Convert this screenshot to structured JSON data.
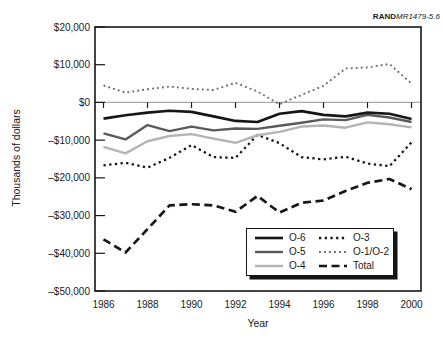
{
  "figure_label": {
    "brand": "RAND",
    "reference": "MR1479-5.6"
  },
  "colors": {
    "background": "#ffffff",
    "axis": "#161616",
    "zero_line": "#a8a8a8",
    "text": "#1a1a1a"
  },
  "chart_data": {
    "type": "line",
    "title": "",
    "xlabel": "Year",
    "ylabel": "Thousands of dollars",
    "x": [
      1986,
      1987,
      1988,
      1989,
      1990,
      1991,
      1992,
      1993,
      1994,
      1995,
      1996,
      1997,
      1998,
      1999,
      2000
    ],
    "xtick_years": [
      1986,
      1988,
      1990,
      1992,
      1994,
      1996,
      1998,
      2000
    ],
    "xtick_labels": [
      "1986",
      "1988",
      "1990",
      "1992",
      "1994",
      "1996",
      "1998",
      "2000"
    ],
    "ytick_values": [
      20000,
      10000,
      0,
      -10000,
      -20000,
      -30000,
      -40000,
      -50000
    ],
    "ytick_labels": [
      "$20,000",
      "$10,000",
      "$0",
      "–$10,000",
      "–$20,000",
      "–$30,000",
      "–$40,000",
      "–$50,000"
    ],
    "ylim": [
      -50000,
      20000
    ],
    "grid": "zero-line-only",
    "legend_position": "inside-bottom-right",
    "series": [
      {
        "name": "O-6",
        "style": "solid",
        "color": "#161616",
        "width": 2.6,
        "dash": "",
        "values": [
          -4300,
          -3400,
          -2700,
          -2200,
          -2500,
          -3700,
          -4900,
          -5200,
          -3000,
          -2300,
          -3300,
          -3700,
          -2700,
          -3000,
          -4400
        ]
      },
      {
        "name": "O-5",
        "style": "solid",
        "color": "#5a5a5a",
        "width": 2.4,
        "dash": "",
        "values": [
          -8200,
          -9800,
          -6000,
          -7600,
          -6400,
          -7400,
          -6900,
          -7000,
          -6200,
          -5400,
          -4500,
          -4700,
          -3300,
          -4000,
          -5200
        ]
      },
      {
        "name": "O-4",
        "style": "solid",
        "color": "#b4b4b4",
        "width": 2.4,
        "dash": "",
        "values": [
          -11800,
          -13500,
          -10300,
          -8900,
          -8400,
          -9600,
          -10700,
          -8700,
          -7800,
          -6400,
          -6100,
          -6700,
          -5300,
          -5800,
          -6600
        ]
      },
      {
        "name": "O-3",
        "style": "dotted",
        "color": "#161616",
        "width": 2.3,
        "dash": "2.3 3.4",
        "values": [
          -16700,
          -16000,
          -17300,
          -14700,
          -11300,
          -14500,
          -14700,
          -8600,
          -10800,
          -14500,
          -15100,
          -14400,
          -16200,
          -16900,
          -10600
        ]
      },
      {
        "name": "O-1/O-2",
        "style": "dotted",
        "color": "#6e6e6e",
        "width": 1.9,
        "dash": "1.9 3.1",
        "values": [
          4500,
          2600,
          3500,
          4200,
          3600,
          3300,
          5200,
          2900,
          -500,
          2000,
          4400,
          9000,
          9300,
          10200,
          5000
        ]
      },
      {
        "name": "Total",
        "style": "dashed",
        "color": "#161616",
        "width": 2.7,
        "dash": "8 4.5",
        "values": [
          -36300,
          -39800,
          -33600,
          -27300,
          -27000,
          -27300,
          -29000,
          -24800,
          -29200,
          -26600,
          -26000,
          -23500,
          -21300,
          -20300,
          -23000
        ]
      }
    ]
  }
}
